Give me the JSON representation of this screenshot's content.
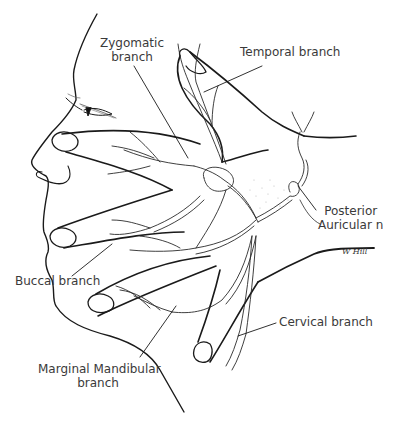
{
  "diagram": {
    "labels": {
      "zygomatic": [
        "Zygomatic",
        "branch"
      ],
      "temporal": "Temporal branch",
      "posterior_auricular": [
        "Posterior",
        "Auricular n"
      ],
      "buccal": "Buccal branch",
      "cervical": "Cervical branch",
      "marginal_mandibular": [
        "Marginal Mandibular",
        "branch"
      ]
    },
    "signature": "W Hill",
    "colors": {
      "ink": "#1a1a1a",
      "nerve": "#2a2a2a",
      "label_text": "#3a3a3a",
      "background": "#ffffff"
    }
  }
}
